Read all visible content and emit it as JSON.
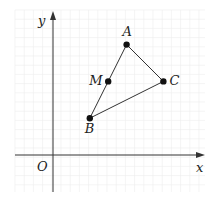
{
  "diagram": {
    "title": "",
    "type": "coordinate-plane-triangle",
    "axes": {
      "x_label": "x",
      "y_label": "y",
      "origin_label": "O"
    },
    "points": [
      {
        "name": "A",
        "label": "A",
        "x": 8,
        "y": 12
      },
      {
        "name": "M",
        "label": "M",
        "x": 6,
        "y": 8
      },
      {
        "name": "C",
        "label": "C",
        "x": 12,
        "y": 8
      },
      {
        "name": "B",
        "label": "B",
        "x": 4,
        "y": 4
      }
    ],
    "segments": [
      {
        "from": "A",
        "to": "B"
      },
      {
        "from": "A",
        "to": "C"
      },
      {
        "from": "B",
        "to": "C"
      }
    ],
    "colors": {
      "line": "#333333",
      "point": "#111111",
      "grid": "#ececec"
    }
  }
}
